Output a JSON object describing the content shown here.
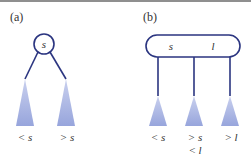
{
  "colors": {
    "node_stroke": "#2b3580",
    "edge": "#2b3580",
    "subtree_fill": "#9aa8dc",
    "subtree_fill_light": "#c3cbec",
    "text": "#333333"
  },
  "panel_a": {
    "label": "(a)",
    "node": {
      "type": "2-node",
      "keys": [
        "s"
      ]
    },
    "subtrees": [
      {
        "label": "< s"
      },
      {
        "label": "> s"
      }
    ]
  },
  "panel_b": {
    "label": "(b)",
    "node": {
      "type": "3-node",
      "keys": [
        "s",
        "l"
      ]
    },
    "subtrees": [
      {
        "label": "< s"
      },
      {
        "label": "> s",
        "label2": "< l"
      },
      {
        "label": "> l"
      }
    ]
  }
}
